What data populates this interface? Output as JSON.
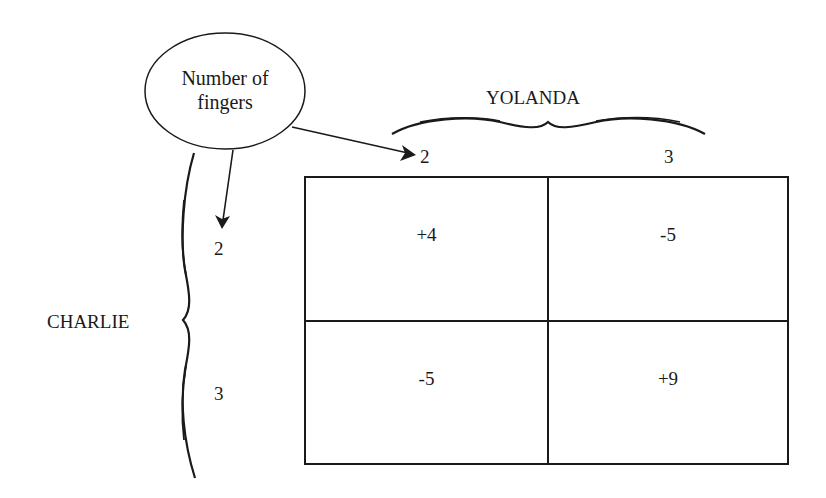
{
  "diagram": {
    "type": "payoff-matrix",
    "annotation": {
      "ellipse_line1": "Number of",
      "ellipse_line2": "fingers"
    },
    "column_player": {
      "name": "YOLANDA",
      "choices": [
        "2",
        "3"
      ]
    },
    "row_player": {
      "name": "CHARLIE",
      "choices": [
        "2",
        "3"
      ]
    },
    "payoffs": [
      [
        "+4",
        "-5"
      ],
      [
        "-5",
        "+9"
      ]
    ],
    "colors": {
      "ink": "#1a1a1a",
      "background": "#ffffff"
    }
  }
}
